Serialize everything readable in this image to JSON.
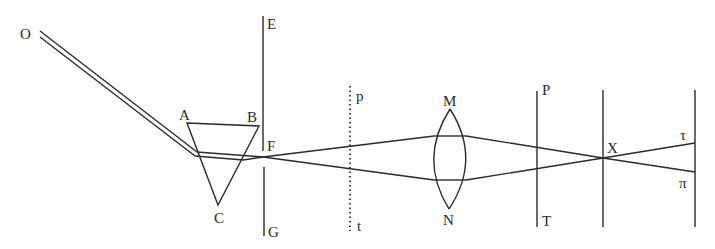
{
  "labels": {
    "O": "O",
    "A": "A",
    "B": "B",
    "C": "C",
    "E": "E",
    "F": "F",
    "G": "G",
    "p": "p",
    "t": "t",
    "M": "M",
    "N": "N",
    "P": "P",
    "T": "T",
    "X": "X",
    "tau": "τ",
    "pi": "π"
  },
  "components": [
    {
      "name": "incident-light-beam",
      "from": "O"
    },
    {
      "name": "prism",
      "vertices": [
        "A",
        "B",
        "C"
      ]
    },
    {
      "name": "screen-with-aperture",
      "endpoints": [
        "E",
        "G"
      ],
      "aperture": "F"
    },
    {
      "name": "dotted-plane",
      "endpoints": [
        "p",
        "t"
      ]
    },
    {
      "name": "convex-lens",
      "endpoints": [
        "M",
        "N"
      ]
    },
    {
      "name": "screen",
      "endpoints": [
        "P",
        "T"
      ]
    },
    {
      "name": "crossing-plane",
      "point": "X"
    },
    {
      "name": "final-screen",
      "points": [
        "τ",
        "π"
      ]
    }
  ],
  "colors": {
    "ink": "#2a2a2a",
    "background": "#ffffff"
  }
}
